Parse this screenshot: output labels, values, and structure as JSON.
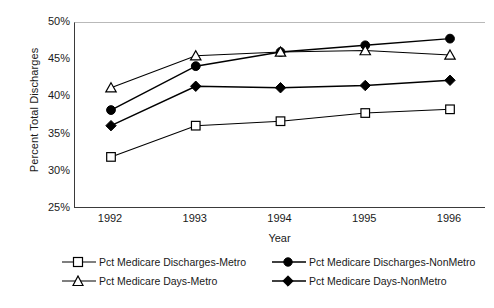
{
  "chart_data": {
    "type": "line",
    "title": "",
    "xlabel": "Year",
    "ylabel": "Percent Total Discharges",
    "categories": [
      "1992",
      "1993",
      "1994",
      "1995",
      "1996"
    ],
    "x": [
      1992,
      1993,
      1994,
      1995,
      1996
    ],
    "ylim": [
      25,
      50
    ],
    "yticks": [
      25,
      30,
      35,
      40,
      45,
      50
    ],
    "ytick_labels": [
      "25%",
      "30%",
      "35%",
      "40%",
      "45%",
      "50%"
    ],
    "grid": false,
    "legend_position": "bottom",
    "series": [
      {
        "name": "Pct Medicare Discharges-Metro",
        "marker": "open-square",
        "color": "#000000",
        "values": [
          32.0,
          36.2,
          36.8,
          37.9,
          38.4
        ]
      },
      {
        "name": "Pct Medicare Discharges-NonMetro",
        "marker": "filled-circle",
        "color": "#000000",
        "values": [
          38.3,
          44.2,
          46.1,
          47.0,
          47.9
        ]
      },
      {
        "name": "Pct Medicare Days-Metro",
        "marker": "open-triangle",
        "color": "#000000",
        "values": [
          41.3,
          45.6,
          46.1,
          46.3,
          45.7
        ]
      },
      {
        "name": "Pct Medicare Days-NonMetro",
        "marker": "filled-diamond",
        "color": "#000000",
        "values": [
          36.2,
          41.5,
          41.3,
          41.6,
          42.3
        ]
      }
    ]
  },
  "axes": {
    "y_title": "Percent Total Discharges",
    "x_title": "Year",
    "y_tick_labels": [
      "50%",
      "45%",
      "40%",
      "35%",
      "30%",
      "25%"
    ],
    "x_tick_labels": [
      "1992",
      "1993",
      "1994",
      "1995",
      "1996"
    ]
  },
  "legend": {
    "items": [
      {
        "label": "Pct Medicare Discharges-Metro",
        "marker": "open-square"
      },
      {
        "label": "Pct Medicare Discharges-NonMetro",
        "marker": "filled-circle"
      },
      {
        "label": "Pct Medicare Days-Metro",
        "marker": "open-triangle"
      },
      {
        "label": "Pct Medicare Days-NonMetro",
        "marker": "filled-diamond"
      }
    ]
  }
}
